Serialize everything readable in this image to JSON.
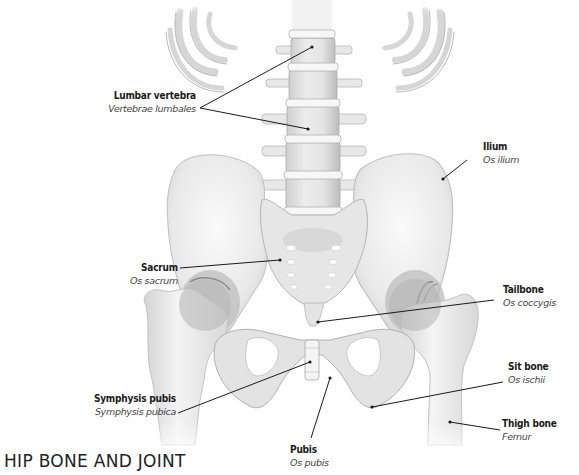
{
  "title": "HIP BONE AND JOINT",
  "labels": {
    "lumbar": {
      "en": "Lumbar vertebra",
      "la": "Vertebrae lumbales"
    },
    "ilium": {
      "en": "Ilium",
      "la": "Os ilium"
    },
    "sacrum": {
      "en": "Sacrum",
      "la": "Os sacrum"
    },
    "tailbone": {
      "en": "Tailbone",
      "la": "Os coccygis"
    },
    "symphysis": {
      "en": "Symphysis pubis",
      "la": "Symphysis pubica"
    },
    "sitbone": {
      "en": "Sit bone",
      "la": "Os ischii"
    },
    "thigh": {
      "en": "Thigh bone",
      "la": "Femur"
    },
    "pubis": {
      "en": "Pubis",
      "la": "Os pubis"
    }
  },
  "colors": {
    "bone": "#efefef",
    "bone_shade": "#c8c8c8",
    "line": "#1a1a1a"
  }
}
